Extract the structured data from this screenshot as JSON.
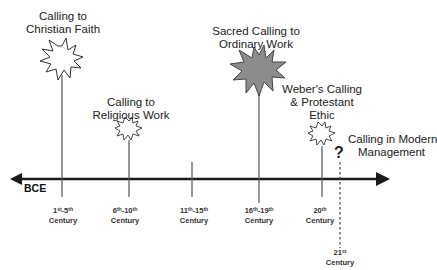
{
  "timeline": {
    "direction_label": "BCE",
    "axis_color": "#1a1a1a",
    "events": [
      {
        "title_line1": "Calling to",
        "title_line2": "Christian Faith",
        "era": "1st-5th Century",
        "marker": "starburst-large-white"
      },
      {
        "title_line1": "Calling to",
        "title_line2": "Religious Work",
        "era": "6th-10th Century",
        "marker": "starburst-small-white"
      },
      {
        "title_line1": "",
        "title_line2": "",
        "era": "11th-15th Century",
        "marker": "none"
      },
      {
        "title_line1": "Sacred Calling to",
        "title_line2": "Ordinary Work",
        "era": "16th-19th Century",
        "marker": "starburst-large-gray"
      },
      {
        "title_line1": "Weber's  Calling",
        "title_line2": "& Protestant",
        "title_line3": "Ethic",
        "era": "20th Century",
        "marker": "starburst-small-white"
      },
      {
        "title_line1": "Calling in Modern",
        "title_line2": "Management",
        "era": "21st Century",
        "marker": "question-mark"
      }
    ],
    "centuries": [
      {
        "num_a": "1",
        "sup_a": "st",
        "num_b": "-5",
        "sup_b": "th",
        "word": "Century"
      },
      {
        "num_a": "6",
        "sup_a": "th",
        "num_b": "-10",
        "sup_b": "th",
        "word": "Century"
      },
      {
        "num_a": "11",
        "sup_a": "th",
        "num_b": "-15",
        "sup_b": "th",
        "word": "Century"
      },
      {
        "num_a": "16",
        "sup_a": "th",
        "num_b": "-19",
        "sup_b": "th",
        "word": "Century"
      },
      {
        "num_a": "20",
        "sup_a": "th",
        "num_b": "",
        "sup_b": "",
        "word": "Century"
      },
      {
        "num_a": "21",
        "sup_a": "st",
        "num_b": "",
        "sup_b": "",
        "word": "Century"
      }
    ],
    "question_glyph": "?",
    "gray_fill": "#8c8c8c"
  }
}
